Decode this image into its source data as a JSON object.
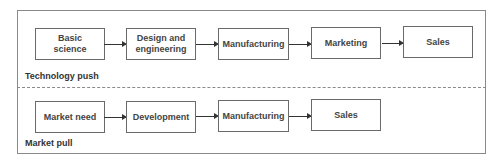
{
  "sections": {
    "technology_push": {
      "label": "Technology push",
      "steps": [
        "Basic\nscience",
        "Design and engineering",
        "Manufacturing",
        "Marketing",
        "Sales"
      ]
    },
    "market_pull": {
      "label": "Market pull",
      "steps": [
        "Market need",
        "Development",
        "Manufacturing",
        "Sales"
      ]
    }
  },
  "colors": {
    "border": "#6a6a6a",
    "text": "#444444",
    "arrow": "#333333"
  }
}
